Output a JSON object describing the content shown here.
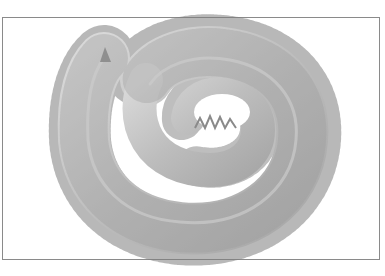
{
  "image": {
    "subject": "coiled bristle worm (polychaete)",
    "frame_color": "#8a8a8a",
    "background": "#ffffff",
    "body_color": "#c4c4c4",
    "bristle_color": "#7e7e7e",
    "highlight_color": "#e6e6e6"
  }
}
